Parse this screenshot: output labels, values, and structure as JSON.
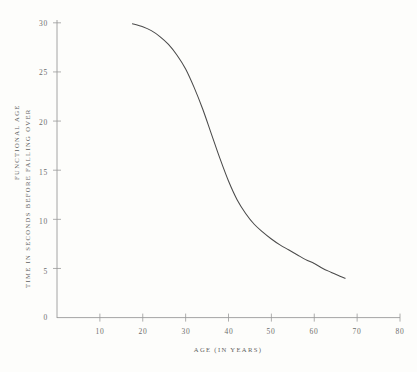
{
  "chart_data": {
    "type": "line",
    "title": "",
    "subtitle": "",
    "xlabel": "AGE (IN YEARS)",
    "ylabel_primary": "TIME IN SECONDS BEFORE FALLING OVER",
    "ylabel_secondary": "FUNCTIONAL AGE",
    "xlim": [
      0,
      80
    ],
    "ylim": [
      0,
      30
    ],
    "xticks": [
      0,
      10,
      20,
      30,
      40,
      50,
      60,
      70,
      80
    ],
    "xtick_labels": [
      "0",
      "10",
      "20",
      "30",
      "40",
      "50",
      "60",
      "70",
      "80"
    ],
    "yticks": [
      5,
      10,
      15,
      20,
      25,
      30
    ],
    "ytick_labels": [
      "5",
      "10",
      "15",
      "20",
      "25",
      "30"
    ],
    "grid": false,
    "legend": false,
    "line_color": "#4a4a4a",
    "axis_color": "#9a9a9a",
    "background_color": "#fdfdfb",
    "series": [
      {
        "name": "Time in seconds before falling over",
        "x": [
          17.6,
          20,
          22,
          24,
          26,
          28,
          30,
          32,
          34,
          36,
          38,
          40,
          42,
          44,
          46,
          48,
          50,
          52,
          54,
          56,
          58,
          60,
          62,
          64,
          66,
          67.2
        ],
        "y": [
          29.9,
          29.6,
          29.2,
          28.6,
          27.8,
          26.7,
          25.3,
          23.4,
          21.2,
          18.7,
          16.2,
          13.9,
          12.0,
          10.6,
          9.5,
          8.7,
          8.0,
          7.4,
          6.9,
          6.4,
          5.9,
          5.5,
          5.0,
          4.6,
          4.2,
          4.0
        ]
      }
    ]
  },
  "axes": {
    "x_title": "AGE (IN YEARS)",
    "y_title_inner": "TIME IN SECONDS BEFORE FALLING OVER",
    "y_title_outer": "FUNCTIONAL AGE",
    "origin_label": "0"
  }
}
